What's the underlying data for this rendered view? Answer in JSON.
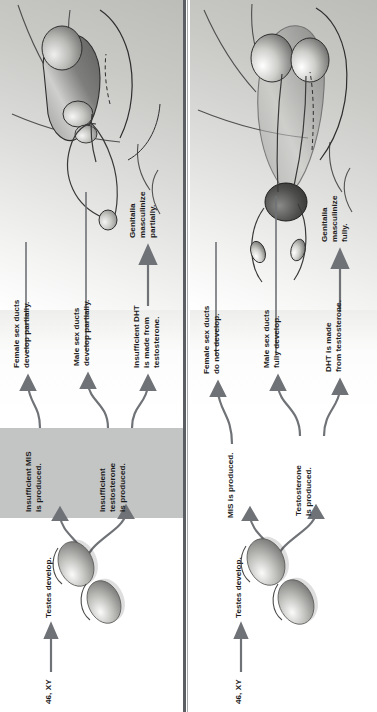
{
  "figure": {
    "type": "biology-flow-diagram",
    "orientation": "rotated-90-ccw",
    "panel_count": 2,
    "colors": {
      "arrow": "#6b6e72",
      "text": "#1c1c1c",
      "highlight_band": "#c3c4c4",
      "divider": "#5b5f63",
      "illustration_bg_light": "#f3f3f2",
      "illustration_bg_dark": "#bcbcb9"
    }
  },
  "panels": [
    {
      "id": "panel-partial",
      "karyotype": "46, XY",
      "gonad_label": "Testes develop.",
      "highlight_band": true,
      "branches": [
        {
          "id": "mis",
          "cause": "Insufficient MIS\nis produced.",
          "effect": "Female sex ducts\ndevelop partially."
        },
        {
          "id": "testosterone",
          "cause": "Insufficient\ntestosterone\nis produced.",
          "effect": "Male sex ducts\ndevelop partially."
        },
        {
          "id": "dht",
          "cause": "Insufficient DHT\nis made from\ntestosterone.",
          "effect": "Genitalia\nmasculinize\npartially."
        }
      ]
    },
    {
      "id": "panel-normal",
      "karyotype": "46, XY",
      "gonad_label": "Testes develop.",
      "highlight_band": false,
      "branches": [
        {
          "id": "mis",
          "cause": "MIS is produced.",
          "effect": "Female sex ducts\ndo not develop."
        },
        {
          "id": "testosterone",
          "cause": "Testosterone\nis produced.",
          "effect": "Male sex ducts\nfully develop."
        },
        {
          "id": "dht",
          "cause": "DHT is made\nfrom testosterone.",
          "effect": "Genitalia\nmasculinize\nfully."
        }
      ]
    }
  ]
}
